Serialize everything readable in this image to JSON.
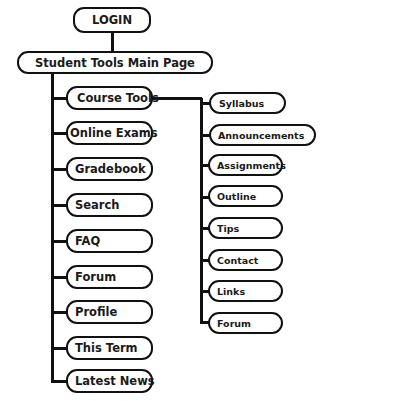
{
  "diagram": {
    "root": {
      "label": "LOGIN"
    },
    "main": {
      "label": "Student Tools Main Page"
    },
    "left_items": [
      {
        "label": "Course Tools"
      },
      {
        "label": "Online Exams"
      },
      {
        "label": "Gradebook"
      },
      {
        "label": "Search"
      },
      {
        "label": "FAQ"
      },
      {
        "label": "Forum"
      },
      {
        "label": "Profile"
      },
      {
        "label": "This Term"
      },
      {
        "label": "Latest News"
      }
    ],
    "course_tools_children": [
      {
        "label": "Syllabus"
      },
      {
        "label": "Announcements"
      },
      {
        "label": "Assignments"
      },
      {
        "label": "Outline"
      },
      {
        "label": "Tips"
      },
      {
        "label": "Contact"
      },
      {
        "label": "Links"
      },
      {
        "label": "Forum"
      }
    ],
    "colors": {
      "stroke": "#111111",
      "fill": "#ffffff",
      "text": "#1a1a1a"
    }
  }
}
